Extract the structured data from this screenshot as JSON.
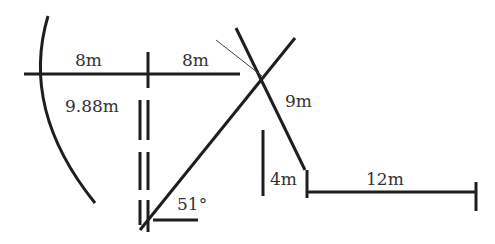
{
  "diagram": {
    "labels": {
      "left_span": "8m",
      "right_span": "8m",
      "vertical_length": "9.88m",
      "diagonal_segment": "9m",
      "short_vertical": "4m",
      "horizontal_segment": "12m",
      "angle": "51°"
    },
    "colors": {
      "stroke": "#1e1e1e",
      "text": "#333333",
      "background": "#ffffff"
    }
  }
}
